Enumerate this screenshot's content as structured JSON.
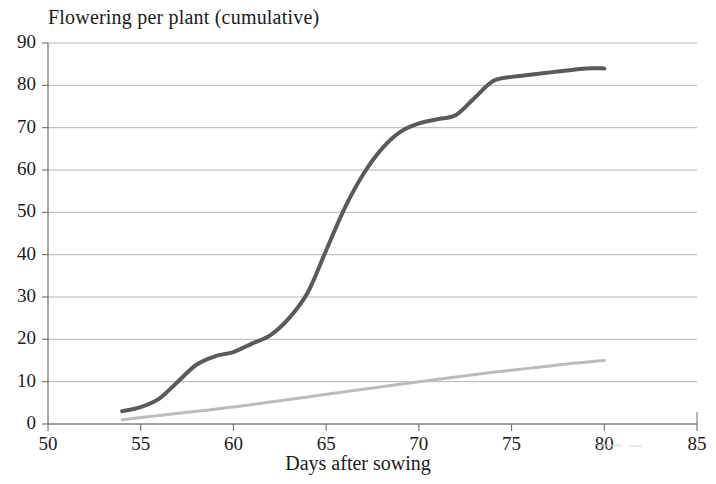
{
  "chart_data": {
    "type": "line",
    "title": "Flowering per plant (cumulative)",
    "xlabel": "Days after sowing",
    "ylabel": "",
    "xlim": [
      50,
      85
    ],
    "ylim": [
      0,
      90
    ],
    "xticks": [
      50,
      55,
      60,
      65,
      70,
      75,
      80,
      85
    ],
    "yticks": [
      0,
      10,
      20,
      30,
      40,
      50,
      60,
      70,
      80,
      90
    ],
    "grid": "horizontal",
    "legend": "none",
    "series": [
      {
        "name": "cumulative-flowering-dark",
        "color": "#5a5a5a",
        "line_width": 4,
        "x": [
          54,
          55,
          56,
          57,
          58,
          59,
          60,
          61,
          62,
          63,
          64,
          65,
          66,
          67,
          68,
          69,
          70,
          71,
          72,
          73,
          74,
          75,
          76,
          77,
          78,
          79,
          80
        ],
        "y": [
          3,
          4,
          6,
          10,
          14,
          16,
          17,
          19,
          21,
          25,
          31,
          41,
          51,
          59,
          65,
          69,
          71,
          72,
          73,
          77,
          81,
          82,
          82.5,
          83,
          83.5,
          84,
          84
        ]
      },
      {
        "name": "flowering-light",
        "color": "#bcbcbc",
        "line_width": 3,
        "x": [
          54,
          56,
          58,
          60,
          62,
          64,
          66,
          68,
          70,
          72,
          74,
          76,
          78,
          80
        ],
        "y": [
          1,
          2,
          3,
          4,
          5.2,
          6.4,
          7.6,
          8.8,
          10,
          11.1,
          12.2,
          13.2,
          14.2,
          15
        ]
      }
    ]
  },
  "axis": {
    "y_tick_labels": [
      "90",
      "80",
      "70",
      "60",
      "50",
      "40",
      "30",
      "20",
      "10",
      "0"
    ],
    "x_tick_labels": [
      "50",
      "55",
      "60",
      "65",
      "70",
      "75",
      "80",
      "85"
    ]
  },
  "colors": {
    "series_dark": "#5a5a5a",
    "series_light": "#bcbcbc",
    "gridline": "#8c8c8c",
    "axis": "#6e6e6e",
    "text": "#1b1b1b",
    "background": "#ffffff"
  }
}
